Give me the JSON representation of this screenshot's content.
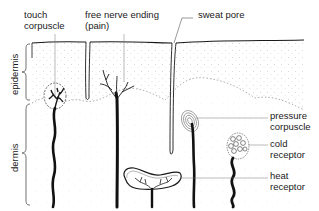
{
  "diagram": {
    "type": "anatomical cross-section of skin showing sensory receptors",
    "colors": {
      "ink": "#1a1a1a",
      "leader": "#555555",
      "stipple": "#b8b8b8"
    },
    "layers": [
      {
        "id": "epidermis",
        "label": "epidermis"
      },
      {
        "id": "dermis",
        "label": "dermis"
      }
    ],
    "labels": {
      "touch_corpuscle": {
        "line1": "touch",
        "line2": "corpuscle"
      },
      "free_nerve_ending": {
        "line1": "free nerve ending",
        "line2": "(pain)"
      },
      "sweat_pore": {
        "line1": "sweat pore"
      },
      "pressure_corpuscle": {
        "line1": "pressure",
        "line2": "corpuscle"
      },
      "cold_receptor": {
        "line1": "cold",
        "line2": "receptor"
      },
      "heat_receptor": {
        "line1": "heat",
        "line2": "receptor"
      }
    }
  }
}
